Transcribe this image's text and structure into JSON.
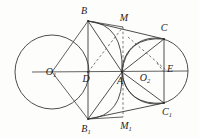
{
  "figure": {
    "stroke_color": "#3a3a3a",
    "dash_color": "#555555",
    "background": "#fdfdfc",
    "width": 199,
    "height": 138
  },
  "labels": {
    "B": "B",
    "M": "M",
    "C": "C",
    "O1": "O",
    "O1_sub": "1",
    "D": "D",
    "A": "A",
    "O2": "O",
    "O2_sub": "2",
    "E": "E",
    "C1": "C",
    "C1_sub": "1",
    "B1": "B",
    "B1_sub": "1",
    "M1": "M",
    "M1_sub": "1"
  },
  "geometry": {
    "points": {
      "B": {
        "x": 88,
        "y": 21
      },
      "B1": {
        "x": 88,
        "y": 119
      },
      "C": {
        "x": 164,
        "y": 39
      },
      "C1": {
        "x": 164,
        "y": 103
      },
      "A": {
        "x": 122,
        "y": 72
      },
      "D": {
        "x": 88,
        "y": 72
      },
      "M": {
        "x": 123,
        "y": 27
      },
      "M1": {
        "x": 123,
        "y": 117
      },
      "E": {
        "x": 163,
        "y": 71
      },
      "O1": {
        "x": 52,
        "y": 72
      },
      "O2": {
        "x": 155,
        "y": 71
      }
    },
    "circles": [
      {
        "name": "circle-O1",
        "cx": 52,
        "cy": 72,
        "r": 37
      },
      {
        "name": "circle-O2",
        "cx": 155,
        "cy": 71,
        "r": 33
      }
    ],
    "label_positions": {
      "B": {
        "x": 84,
        "y": 11
      },
      "M": {
        "x": 124,
        "y": 18
      },
      "C": {
        "x": 164,
        "y": 28
      },
      "O1": {
        "x": 51,
        "y": 72
      },
      "D": {
        "x": 86,
        "y": 79
      },
      "A": {
        "x": 120,
        "y": 81
      },
      "O2": {
        "x": 145,
        "y": 78
      },
      "E": {
        "x": 170,
        "y": 69
      },
      "C1": {
        "x": 167,
        "y": 112
      },
      "B1": {
        "x": 86,
        "y": 129
      },
      "M1": {
        "x": 126,
        "y": 126
      }
    }
  }
}
